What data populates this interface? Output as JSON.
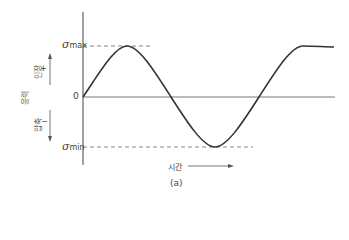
{
  "diagram": {
    "type": "sinusoidal fully reversed stress cycle",
    "y_axis_label": "응력",
    "tension_label": "인장",
    "tension_sign": "+",
    "compression_label": "압축",
    "compression_sign": "−",
    "origin_label": "0",
    "max_label": {
      "symbol": "σ",
      "subscript": "max"
    },
    "min_label": {
      "symbol": "σ",
      "subscript": "min"
    },
    "x_axis_label": "시간",
    "caption": "(a)",
    "colors": {
      "curve": "#333333",
      "axis": "#444444",
      "dash": "#666666",
      "text": "#444444"
    }
  }
}
